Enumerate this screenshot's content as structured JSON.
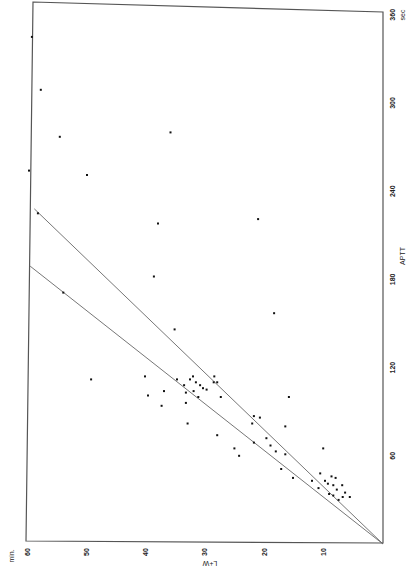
{
  "chart_data": {
    "type": "scatter",
    "title": "",
    "orientation": "rotated-90",
    "xlabel": "L+W",
    "x_unit": "min.",
    "ylabel": "APTT",
    "y_unit": "sec",
    "xlim": [
      0,
      60
    ],
    "ylim": [
      0,
      360
    ],
    "x_ticks": [
      10,
      20,
      30,
      40,
      50,
      60
    ],
    "y_ticks": [
      60,
      120,
      180,
      240,
      300,
      360
    ],
    "grid": false,
    "legend": null,
    "series": [
      {
        "name": "observations",
        "points": [
          [
            59.3,
            345
          ],
          [
            57.8,
            309
          ],
          [
            54.6,
            277
          ],
          [
            35.9,
            280
          ],
          [
            59.8,
            254
          ],
          [
            50.0,
            251
          ],
          [
            58.3,
            225
          ],
          [
            21.1,
            221
          ],
          [
            38.0,
            218
          ],
          [
            38.7,
            182
          ],
          [
            54.0,
            171
          ],
          [
            18.4,
            157
          ],
          [
            35.2,
            146
          ],
          [
            49.3,
            112
          ],
          [
            40.2,
            114
          ],
          [
            37.0,
            104
          ],
          [
            34.8,
            112
          ],
          [
            33.6,
            108
          ],
          [
            32.6,
            112
          ],
          [
            32.1,
            114
          ],
          [
            31.6,
            110
          ],
          [
            30.9,
            108
          ],
          [
            30.4,
            106
          ],
          [
            28.0,
            110
          ],
          [
            28.5,
            114
          ],
          [
            33.3,
            103
          ],
          [
            32.0,
            104
          ],
          [
            31.2,
            100
          ],
          [
            29.8,
            105
          ],
          [
            27.4,
            100
          ],
          [
            39.7,
            101
          ],
          [
            37.4,
            94
          ],
          [
            33.3,
            96
          ],
          [
            28.6,
            110
          ],
          [
            33.0,
            82
          ],
          [
            21.8,
            87
          ],
          [
            20.8,
            86
          ],
          [
            22.1,
            82
          ],
          [
            19.7,
            72
          ],
          [
            16.5,
            80
          ],
          [
            15.9,
            100
          ],
          [
            28.0,
            74
          ],
          [
            25.1,
            65
          ],
          [
            24.3,
            60
          ],
          [
            21.8,
            69
          ],
          [
            18.1,
            63
          ],
          [
            19.0,
            67
          ],
          [
            16.5,
            61
          ],
          [
            17.2,
            51
          ],
          [
            15.2,
            45
          ],
          [
            10.1,
            65
          ],
          [
            10.6,
            48
          ],
          [
            9.8,
            43
          ],
          [
            9.3,
            41
          ],
          [
            8.4,
            40
          ],
          [
            8.7,
            46
          ],
          [
            8.0,
            45
          ],
          [
            7.8,
            37
          ],
          [
            6.9,
            40
          ],
          [
            6.4,
            35
          ],
          [
            5.6,
            32
          ],
          [
            6.8,
            32
          ],
          [
            7.5,
            30
          ],
          [
            8.4,
            33
          ],
          [
            9.1,
            34
          ],
          [
            10.9,
            38
          ],
          [
            12.0,
            43
          ]
        ]
      }
    ],
    "reference_lines": [
      {
        "name": "upper-regression-line",
        "from": [
          0,
          0
        ],
        "to": [
          58.9,
          228
        ]
      },
      {
        "name": "lower-regression-line",
        "from": [
          0,
          0
        ],
        "to": [
          59.6,
          189
        ]
      }
    ]
  },
  "axes": {
    "x_title": "L+W",
    "x_unit": "min.",
    "y_title": "APTT",
    "y_unit": "sec",
    "x_tick_labels": [
      "10",
      "20",
      "30",
      "40",
      "50",
      "60"
    ],
    "y_tick_labels": [
      "60",
      "120",
      "180",
      "240",
      "300",
      "360"
    ]
  }
}
